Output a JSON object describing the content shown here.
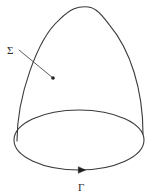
{
  "figure": {
    "kind": "math-diagram",
    "background_color": "#ffffff",
    "stroke_color": "#3a3a3a",
    "label_color": "#2b2b2b",
    "stroke_width": 1.1,
    "surface": {
      "name": "surface-sigma",
      "label": "Σ",
      "label_x": 7,
      "label_y": 54,
      "apex": {
        "x": 85,
        "y": 10
      },
      "left_foot": {
        "x": 17,
        "y": 141
      },
      "right_foot": {
        "x": 143,
        "y": 134
      },
      "leader": {
        "start_x": 19,
        "start_y": 50,
        "end_x": 53,
        "end_y": 78,
        "dot_radius": 1.8
      }
    },
    "boundary": {
      "name": "boundary-gamma",
      "label": "Γ",
      "label_x": 78,
      "label_y": 191,
      "center_x": 79,
      "center_y": 140,
      "radius_x": 65,
      "radius_y": 30,
      "orientation": "clockwise",
      "arrow": {
        "x": 82,
        "y": 170,
        "direction": "right",
        "size": 6
      }
    }
  }
}
